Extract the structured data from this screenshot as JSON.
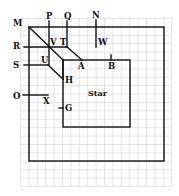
{
  "diagram": {
    "labels": {
      "M": "M",
      "P": "P",
      "Q": "Q",
      "N": "N",
      "R": "R",
      "V": "V",
      "T": "T",
      "W": "W",
      "S": "S",
      "U": "U",
      "A": "A",
      "B": "B",
      "H": "H",
      "O": "O",
      "X": "X",
      "G": "G"
    },
    "center_label": "Star",
    "colors": {
      "line": "#111111",
      "grid": "#d2d2d2",
      "background": "#ffffff"
    }
  }
}
